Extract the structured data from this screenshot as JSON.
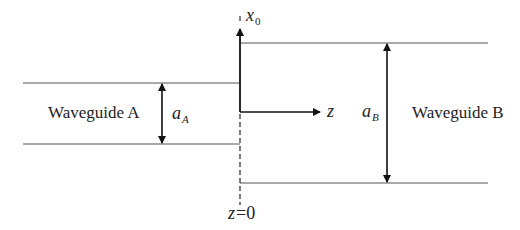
{
  "diagram": {
    "type": "waveguide-junction",
    "waveguide_a": {
      "label": "Waveguide A",
      "width_symbol": "a",
      "width_subscript": "A"
    },
    "waveguide_b": {
      "label": "Waveguide B",
      "width_symbol": "a",
      "width_subscript": "B"
    },
    "axes": {
      "transverse_axis_symbol": "x",
      "transverse_axis_subscript": "0",
      "propagation_axis_symbol": "z",
      "junction_label_var": "z",
      "junction_label_eq": "=0"
    },
    "colors": {
      "line": "#555555",
      "arrow": "#111111",
      "text": "#222222"
    }
  }
}
